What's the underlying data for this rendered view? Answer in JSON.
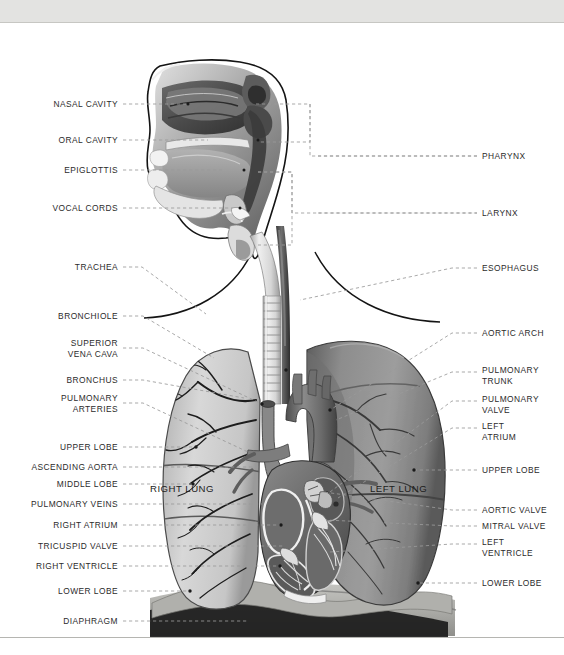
{
  "figure": {
    "style": "grayscale medical illustration with dashed leader lines"
  },
  "colors": {
    "header_bar": "#e3e3e1",
    "label_text": "#2b2b2b",
    "leader_line": "#9a9a9a",
    "outline": "#1a1a1a",
    "right_lung": "#cfcfcf",
    "left_lung": "#8e8e8e",
    "heart": "#6e6e6e",
    "torso": "#b4b4b0",
    "background": "#ffffff"
  },
  "labels_left": [
    {
      "id": "nasal-cavity",
      "text": "NASAL CAVITY",
      "lines": [
        "NASAL CAVITY"
      ],
      "x": 118,
      "y": 104
    },
    {
      "id": "oral-cavity",
      "text": "ORAL CAVITY",
      "lines": [
        "ORAL CAVITY"
      ],
      "x": 118,
      "y": 140
    },
    {
      "id": "epiglottis",
      "text": "EPIGLOTTIS",
      "lines": [
        "EPIGLOTTIS"
      ],
      "x": 118,
      "y": 170
    },
    {
      "id": "vocal-cords",
      "text": "VOCAL CORDS",
      "lines": [
        "VOCAL CORDS"
      ],
      "x": 118,
      "y": 208
    },
    {
      "id": "trachea",
      "text": "TRACHEA",
      "lines": [
        "TRACHEA"
      ],
      "x": 118,
      "y": 267
    },
    {
      "id": "bronchiole",
      "text": "BRONCHIOLE",
      "lines": [
        "BRONCHIOLE"
      ],
      "x": 118,
      "y": 316
    },
    {
      "id": "superior-vena-cava",
      "text": "SUPERIOR VENA CAVA",
      "lines": [
        "SUPERIOR",
        "VENA CAVA"
      ],
      "x": 118,
      "y": 348
    },
    {
      "id": "bronchus",
      "text": "BRONCHUS",
      "lines": [
        "BRONCHUS"
      ],
      "x": 118,
      "y": 380
    },
    {
      "id": "pulmonary-arteries",
      "text": "PULMONARY ARTERIES",
      "lines": [
        "PULMONARY",
        "ARTERIES"
      ],
      "x": 118,
      "y": 403
    },
    {
      "id": "upper-lobe-right",
      "text": "UPPER LOBE",
      "lines": [
        "UPPER LOBE"
      ],
      "x": 118,
      "y": 447
    },
    {
      "id": "ascending-aorta",
      "text": "ASCENDING AORTA",
      "lines": [
        "ASCENDING AORTA"
      ],
      "x": 118,
      "y": 467
    },
    {
      "id": "middle-lobe",
      "text": "MIDDLE LOBE",
      "lines": [
        "MIDDLE LOBE"
      ],
      "x": 118,
      "y": 484
    },
    {
      "id": "pulmonary-veins",
      "text": "PULMONARY VEINS",
      "lines": [
        "PULMONARY VEINS"
      ],
      "x": 118,
      "y": 504
    },
    {
      "id": "right-atrium",
      "text": "RIGHT ATRIUM",
      "lines": [
        "RIGHT ATRIUM"
      ],
      "x": 118,
      "y": 525
    },
    {
      "id": "tricuspid-valve",
      "text": "TRICUSPID VALVE",
      "lines": [
        "TRICUSPID VALVE"
      ],
      "x": 118,
      "y": 546
    },
    {
      "id": "right-ventricle",
      "text": "RIGHT VENTRICLE",
      "lines": [
        "RIGHT VENTRICLE"
      ],
      "x": 118,
      "y": 566
    },
    {
      "id": "lower-lobe-right",
      "text": "LOWER LOBE",
      "lines": [
        "LOWER LOBE"
      ],
      "x": 118,
      "y": 591
    },
    {
      "id": "diaphragm",
      "text": "DIAPHRAGM",
      "lines": [
        "DIAPHRAGM"
      ],
      "x": 118,
      "y": 621
    }
  ],
  "labels_right": [
    {
      "id": "pharynx",
      "text": "PHARYNX",
      "lines": [
        "PHARYNX"
      ],
      "x": 482,
      "y": 156
    },
    {
      "id": "larynx",
      "text": "LARYNX",
      "lines": [
        "LARYNX"
      ],
      "x": 482,
      "y": 213
    },
    {
      "id": "esophagus",
      "text": "ESOPHAGUS",
      "lines": [
        "ESOPHAGUS"
      ],
      "x": 482,
      "y": 268
    },
    {
      "id": "aortic-arch",
      "text": "AORTIC ARCH",
      "lines": [
        "AORTIC ARCH"
      ],
      "x": 482,
      "y": 333
    },
    {
      "id": "pulmonary-trunk",
      "text": "PULMONARY TRUNK",
      "lines": [
        "PULMONARY",
        "TRUNK"
      ],
      "x": 482,
      "y": 375
    },
    {
      "id": "pulmonary-valve",
      "text": "PULMONARY VALVE",
      "lines": [
        "PULMONARY",
        "VALVE"
      ],
      "x": 482,
      "y": 404
    },
    {
      "id": "left-atrium",
      "text": "LEFT ATRIUM",
      "lines": [
        "LEFT",
        "ATRIUM"
      ],
      "x": 482,
      "y": 431
    },
    {
      "id": "upper-lobe-left",
      "text": "UPPER LOBE",
      "lines": [
        "UPPER LOBE"
      ],
      "x": 482,
      "y": 470
    },
    {
      "id": "aortic-valve",
      "text": "AORTIC VALVE",
      "lines": [
        "AORTIC VALVE"
      ],
      "x": 482,
      "y": 510
    },
    {
      "id": "mitral-valve",
      "text": "MITRAL VALVE",
      "lines": [
        "MITRAL VALVE"
      ],
      "x": 482,
      "y": 526
    },
    {
      "id": "left-ventricle",
      "text": "LEFT VENTRICLE",
      "lines": [
        "LEFT",
        "VENTRICLE"
      ],
      "x": 482,
      "y": 547
    },
    {
      "id": "lower-lobe-left",
      "text": "LOWER LOBE",
      "lines": [
        "LOWER LOBE"
      ],
      "x": 482,
      "y": 583
    }
  ],
  "labels_on_art": [
    {
      "id": "right-lung",
      "text": "RIGHT LUNG",
      "x": 150,
      "y": 488
    },
    {
      "id": "left-lung",
      "text": "LEFT LUNG",
      "x": 370,
      "y": 488
    }
  ]
}
